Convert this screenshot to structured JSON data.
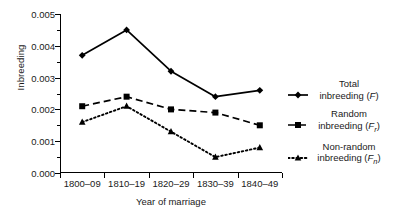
{
  "chart_data": {
    "type": "line",
    "title": "",
    "xlabel": "Year of marriage",
    "ylabel": "Inbreeding",
    "categories": [
      "1800–09",
      "1810–19",
      "1820–29",
      "1830–39",
      "1840–49"
    ],
    "ylim": [
      0.0,
      0.005
    ],
    "ytick_labels": [
      "0.000",
      "0.001",
      "0.002",
      "0.003",
      "0.004",
      "0.005"
    ],
    "ytick_values": [
      0.0,
      0.001,
      0.002,
      0.003,
      0.004,
      0.005
    ],
    "yminor_values": [
      0.0005,
      0.0015,
      0.0025,
      0.0035,
      0.0045
    ],
    "grid": false,
    "legend_position": "right",
    "series": [
      {
        "name": "Total inbreeding (F)",
        "legend_line1": "Total",
        "legend_line2_prefix": "inbreeding (",
        "legend_symbol": "F",
        "legend_subscript": "",
        "legend_line2_suffix": ")",
        "marker": "diamond",
        "linestyle": "solid",
        "color": "#000000",
        "values": [
          0.0037,
          0.0045,
          0.0032,
          0.0024,
          0.0026
        ]
      },
      {
        "name": "Random inbreeding (Fr)",
        "legend_line1": "Random",
        "legend_line2_prefix": "inbreeding (",
        "legend_symbol": "F",
        "legend_subscript": "r",
        "legend_line2_suffix": ")",
        "marker": "square",
        "linestyle": "dashed",
        "color": "#000000",
        "values": [
          0.0021,
          0.0024,
          0.002,
          0.0019,
          0.0015
        ]
      },
      {
        "name": "Non-random inbreeding (Fn)",
        "legend_line1": "Non-random",
        "legend_line2_prefix": "inbreeding (",
        "legend_symbol": "F",
        "legend_subscript": "n",
        "legend_line2_suffix": ")",
        "marker": "triangle",
        "linestyle": "dotted",
        "color": "#000000",
        "values": [
          0.0016,
          0.0021,
          0.0013,
          0.0005,
          0.0008
        ]
      }
    ]
  }
}
